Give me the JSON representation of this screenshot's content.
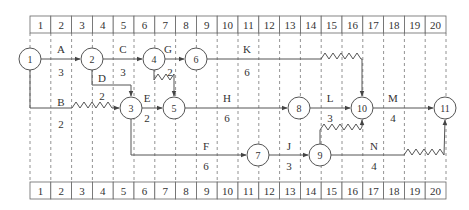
{
  "timescale": {
    "columns": [
      "1",
      "2",
      "3",
      "4",
      "5",
      "6",
      "7",
      "8",
      "9",
      "10",
      "11",
      "12",
      "13",
      "14",
      "15",
      "16",
      "17",
      "18",
      "19",
      "20"
    ],
    "x_start": 30,
    "col_width": 20.8,
    "top": {
      "y": 16,
      "h": 17
    },
    "bottom": {
      "y": 182,
      "h": 17
    }
  },
  "nodes": [
    {
      "id": "1",
      "x": 30,
      "y": 59
    },
    {
      "id": "2",
      "x": 92,
      "y": 59
    },
    {
      "id": "4",
      "x": 154,
      "y": 59
    },
    {
      "id": "6",
      "x": 196,
      "y": 59
    },
    {
      "id": "3",
      "x": 131,
      "y": 108
    },
    {
      "id": "5",
      "x": 174,
      "y": 108
    },
    {
      "id": "8",
      "x": 299,
      "y": 108
    },
    {
      "id": "10",
      "x": 362,
      "y": 108
    },
    {
      "id": "11",
      "x": 445,
      "y": 108
    },
    {
      "id": "7",
      "x": 258,
      "y": 155
    },
    {
      "id": "9",
      "x": 320,
      "y": 155
    }
  ],
  "activities": [
    {
      "name": "A",
      "duration": "3",
      "name_pos": [
        61,
        49
      ],
      "dur_pos": [
        61,
        72
      ]
    },
    {
      "name": "B",
      "duration": "2",
      "name_pos": [
        61,
        102
      ],
      "dur_pos": [
        61,
        124
      ]
    },
    {
      "name": "C",
      "duration": "3",
      "name_pos": [
        123,
        49
      ],
      "dur_pos": [
        123,
        72
      ]
    },
    {
      "name": "D",
      "duration": "2",
      "name_pos": [
        102,
        78
      ],
      "dur_pos": [
        102,
        96
      ]
    },
    {
      "name": "E",
      "duration": "2",
      "name_pos": [
        147,
        98
      ],
      "dur_pos": [
        147,
        118
      ]
    },
    {
      "name": "G",
      "duration": "2",
      "name_pos": [
        168,
        49
      ],
      "dur_pos": [
        170,
        72
      ]
    },
    {
      "name": "K",
      "duration": "6",
      "name_pos": [
        247,
        49
      ],
      "dur_pos": [
        247,
        72
      ]
    },
    {
      "name": "H",
      "duration": "6",
      "name_pos": [
        227,
        98
      ],
      "dur_pos": [
        227,
        118
      ]
    },
    {
      "name": "L",
      "duration": "3",
      "name_pos": [
        330,
        98
      ],
      "dur_pos": [
        330,
        118
      ]
    },
    {
      "name": "M",
      "duration": "4",
      "name_pos": [
        393,
        98
      ],
      "dur_pos": [
        393,
        118
      ]
    },
    {
      "name": "F",
      "duration": "6",
      "name_pos": [
        206,
        146
      ],
      "dur_pos": [
        206,
        166
      ]
    },
    {
      "name": "J",
      "duration": "3",
      "name_pos": [
        289,
        146
      ],
      "dur_pos": [
        289,
        166
      ]
    },
    {
      "name": "N",
      "duration": "4",
      "name_pos": [
        374,
        146
      ],
      "dur_pos": [
        374,
        166
      ]
    }
  ]
}
